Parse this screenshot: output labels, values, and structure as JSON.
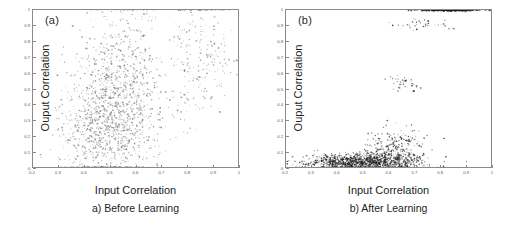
{
  "figure": {
    "panel_count": 2
  },
  "axes": {
    "xlabel": "Input Correlation",
    "ylabel": "Ouput Correlation",
    "xticks": [
      "0.2",
      "0.3",
      "0.4",
      "0.5",
      "0.6",
      "0.7",
      "0.8",
      "0.9",
      "1"
    ],
    "yticks": [
      "0",
      "0.1",
      "0.2",
      "0.3",
      "0.4",
      "0.5",
      "0.6",
      "0.7",
      "0.8",
      "0.9",
      "1"
    ],
    "xlim": [
      0.2,
      1.0
    ],
    "ylim": [
      0.0,
      1.0
    ]
  },
  "panel_a": {
    "tag": "(a)",
    "caption": "a) Before Learning",
    "xlabel": "Input Correlation",
    "ylabel": "Ouput Correlation"
  },
  "panel_b": {
    "tag": "(b)",
    "caption": "b) After Learning",
    "xlabel": "Input Correlation",
    "ylabel": "Ouput Correlation"
  },
  "colors": {
    "marker_before": "#7d7d7d",
    "marker_after": "#1c1c1c",
    "frame": "#8a8a8a",
    "text": "#1d1d1d",
    "background": "#ffffff"
  },
  "chart_data": [
    {
      "type": "scatter",
      "title": "a) Before Learning",
      "xlabel": "Input Correlation",
      "ylabel": "Ouput Correlation",
      "xlim": [
        0.2,
        1.0
      ],
      "ylim": [
        0.0,
        1.0
      ],
      "grid": false,
      "legend": "none",
      "marker_color": "#7d7d7d",
      "n_points": 1800,
      "description": "Diffuse cloud with no clear correlation; input correlation spans 0.30-0.95, output correlation spans the full 0-1 range. Highest density near input 0.45-0.60 and output 0.15-0.45, with a secondary scattered column near input 0.80-0.92.",
      "density_clusters": [
        {
          "x_center": 0.52,
          "y_center": 0.3,
          "x_spread": 0.09,
          "y_spread": 0.22,
          "weight": 0.62
        },
        {
          "x_center": 0.56,
          "y_center": 0.7,
          "x_spread": 0.07,
          "y_spread": 0.2,
          "weight": 0.16
        },
        {
          "x_center": 0.85,
          "y_center": 0.72,
          "x_spread": 0.06,
          "y_spread": 0.22,
          "weight": 0.13
        },
        {
          "x_center": 0.4,
          "y_center": 0.25,
          "x_spread": 0.06,
          "y_spread": 0.16,
          "weight": 0.09
        }
      ]
    },
    {
      "type": "scatter",
      "title": "b) After Learning",
      "xlabel": "Input Correlation",
      "ylabel": "Ouput Correlation",
      "xlim": [
        0.2,
        1.0
      ],
      "ylim": [
        0.0,
        1.0
      ],
      "grid": false,
      "legend": "none",
      "marker_color": "#1c1c1c",
      "n_points": 1800,
      "description": "Strongly nonlinear, saturating relationship. A dense dark band hugs output correlation 0.00-0.10 rising gradually from input 0.25 to input 0.68, then flares up to about 0.30. A separate saturated band sits at output = 1.0 spanning input 0.72-0.95. Sparse isolated outliers appear near output 0.50-0.58 at input 0.62-0.68 and near output 0.90-0.93 at input 0.66-0.80.",
      "density_clusters": [
        {
          "x_center": 0.5,
          "y_center": 0.035,
          "x_spread": 0.11,
          "y_spread": 0.025,
          "weight": 0.58
        },
        {
          "x_center": 0.63,
          "y_center": 0.11,
          "x_spread": 0.05,
          "y_spread": 0.07,
          "weight": 0.16
        },
        {
          "x_center": 0.84,
          "y_center": 1.0,
          "x_spread": 0.06,
          "y_spread": 0.004,
          "weight": 0.22
        },
        {
          "x_center": 0.66,
          "y_center": 0.53,
          "x_spread": 0.03,
          "y_spread": 0.03,
          "weight": 0.02
        },
        {
          "x_center": 0.73,
          "y_center": 0.915,
          "x_spread": 0.06,
          "y_spread": 0.02,
          "weight": 0.02
        }
      ]
    }
  ]
}
